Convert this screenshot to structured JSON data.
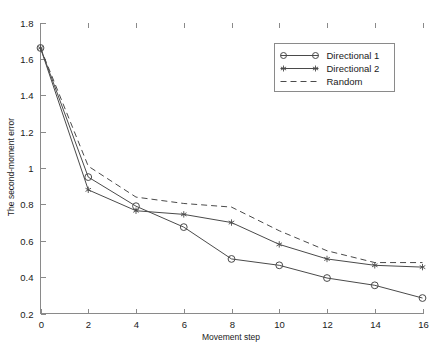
{
  "chart_data": {
    "type": "line",
    "title": "",
    "subtitle": "",
    "xlabel": "Movement step",
    "ylabel": "The second-moment error",
    "xlim": [
      0,
      16
    ],
    "ylim": [
      0.2,
      1.8
    ],
    "xticks": [
      0,
      2,
      4,
      6,
      8,
      10,
      12,
      14,
      16
    ],
    "xticklabels": [
      "0",
      "2",
      "4",
      "6",
      "8",
      "10",
      "12",
      "14",
      "16"
    ],
    "yticks": [
      0.2,
      0.4,
      0.6,
      0.8,
      1.0,
      1.2,
      1.4,
      1.6,
      1.8
    ],
    "yticklabels": [
      "0.2",
      "0.4",
      "0.6",
      "0.8",
      "1",
      "1.2",
      "1.4",
      "1.6",
      "1.8"
    ],
    "grid": false,
    "legend_position": "upper right",
    "x": [
      0,
      2,
      4,
      6,
      8,
      10,
      12,
      14,
      16
    ],
    "series": [
      {
        "name": "Directional 1",
        "marker": "circle",
        "linestyle": "solid",
        "color": "#4a4a4a",
        "values": [
          1.66,
          0.95,
          0.79,
          0.675,
          0.5,
          0.465,
          0.395,
          0.355,
          0.285
        ]
      },
      {
        "name": "Directional 2",
        "marker": "star",
        "linestyle": "solid",
        "color": "#4a4a4a",
        "values": [
          1.66,
          0.88,
          0.765,
          0.745,
          0.7,
          0.58,
          0.5,
          0.465,
          0.455
        ]
      },
      {
        "name": "Random",
        "marker": "none",
        "linestyle": "dashed",
        "color": "#4a4a4a",
        "values": [
          1.66,
          1.01,
          0.84,
          0.805,
          0.785,
          0.655,
          0.545,
          0.48,
          0.48
        ]
      }
    ]
  },
  "legend": {
    "entries": [
      {
        "label": "Directional 1"
      },
      {
        "label": "Directional 2"
      },
      {
        "label": "Random"
      }
    ]
  },
  "axes": {
    "x_title": "Movement step",
    "y_title": "The second-moment error"
  }
}
